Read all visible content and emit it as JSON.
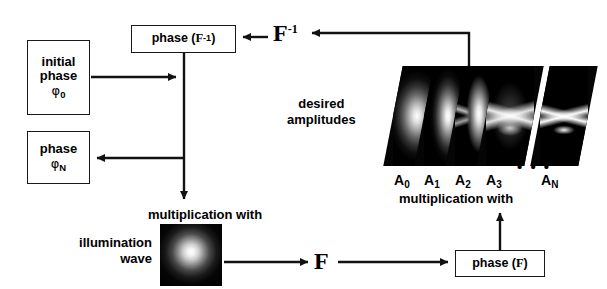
{
  "diagram": {
    "boxes": {
      "initial_phase": {
        "line1": "initial",
        "line2": "phase",
        "symbol": "φ",
        "subscript": "0"
      },
      "phase_n": {
        "line1": "phase",
        "symbol": "φ",
        "subscript": "N"
      },
      "phase_finv": {
        "prefix": "phase (",
        "symbol": "F",
        "superscript": "-1",
        "suffix": ")"
      },
      "phase_f": {
        "prefix": "phase (",
        "symbol": "F",
        "suffix": ")"
      }
    },
    "operators": {
      "inverse_fourier": {
        "symbol": "F",
        "superscript": "-1"
      },
      "fourier": {
        "symbol": "F"
      }
    },
    "labels": {
      "desired_amplitudes_line1": "desired",
      "desired_amplitudes_line2": "amplitudes",
      "multiplication_with_top": "multiplication with",
      "multiplication_with_bottom": "multiplication with",
      "illumination_line1": "illumination",
      "illumination_line2": "wave",
      "ellipsis": "• • •"
    },
    "amplitudes": [
      {
        "id": "A0",
        "symbol": "A",
        "subscript": "0",
        "description": "broad diffuse bright blob"
      },
      {
        "id": "A1",
        "symbol": "A",
        "subscript": "1",
        "description": "narrow vertical bright blob"
      },
      {
        "id": "A2",
        "symbol": "A",
        "subscript": "2",
        "description": "blob forming letter A"
      },
      {
        "id": "A3",
        "symbol": "A",
        "subscript": "3",
        "description": "partially resolved letter A"
      },
      {
        "id": "AN",
        "symbol": "A",
        "subscript": "N",
        "description": "sharp letter A"
      }
    ],
    "illumination_image": {
      "description": "black square with central white Gaussian spot"
    },
    "colors": {
      "stroke": "#1a1a1a",
      "background": "#ffffff",
      "panel": "#050505",
      "text": "#000000"
    }
  }
}
